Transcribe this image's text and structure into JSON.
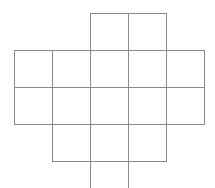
{
  "diagram": {
    "type": "grid-net",
    "line_color": "#8a8a8a",
    "cell_size": 38,
    "columns_x": [
      14,
      52,
      90,
      128,
      166,
      204
    ],
    "rows_y": [
      13,
      50,
      87,
      124,
      161,
      188
    ],
    "cells": [
      {
        "row": 0,
        "col": 2
      },
      {
        "row": 0,
        "col": 3
      },
      {
        "row": 1,
        "col": 0
      },
      {
        "row": 1,
        "col": 1
      },
      {
        "row": 1,
        "col": 2
      },
      {
        "row": 1,
        "col": 3
      },
      {
        "row": 1,
        "col": 4
      },
      {
        "row": 2,
        "col": 0
      },
      {
        "row": 2,
        "col": 1
      },
      {
        "row": 2,
        "col": 2
      },
      {
        "row": 2,
        "col": 3
      },
      {
        "row": 2,
        "col": 4
      },
      {
        "row": 3,
        "col": 1
      },
      {
        "row": 3,
        "col": 2
      },
      {
        "row": 3,
        "col": 3
      },
      {
        "row": 4,
        "col": 2,
        "open_bottom": true
      }
    ]
  }
}
